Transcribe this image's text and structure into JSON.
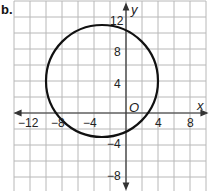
{
  "part_label": "b.",
  "chart_data": {
    "type": "scatter",
    "title": "",
    "xlabel": "x",
    "ylabel": "y",
    "origin_label": "O",
    "xlim": [
      -14,
      10
    ],
    "ylim": [
      -10,
      14
    ],
    "grid": true,
    "grid_step": 2,
    "x_ticks": [
      -12,
      -8,
      -4,
      4,
      8
    ],
    "y_ticks": [
      12,
      8,
      4,
      -4,
      -8
    ],
    "shapes": [
      {
        "type": "circle",
        "center": [
          -3,
          4
        ],
        "radius": 7
      }
    ]
  },
  "labels": {
    "x": "x",
    "y": "y",
    "origin": "O",
    "xt_m12": "−12",
    "xt_m8": "−8",
    "xt_m4": "−4",
    "xt_4": "4",
    "xt_8": "8",
    "yt_12": "12",
    "yt_8": "8",
    "yt_4": "4",
    "yt_m4": "−4",
    "yt_m8": "−8"
  },
  "colors": {
    "grid": "#b8b8b8",
    "axis": "#333333",
    "circle": "#111111"
  }
}
